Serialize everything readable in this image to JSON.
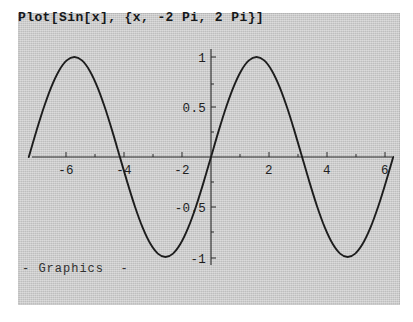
{
  "window": {
    "background_color": "#ffffff",
    "panel_color": "#c9c9c9"
  },
  "cell": {
    "input_title": "Plot[Sin[x], {x, -2 Pi, 2 Pi}]",
    "output_label": "- Graphics  -"
  },
  "chart_data": {
    "type": "line",
    "title": "Plot[Sin[x], {x, -2 Pi, 2 Pi}]",
    "function": "Sin[x]",
    "variable": "x",
    "domain_expression": "{x, -2 Pi, 2 Pi}",
    "xlabel": "",
    "ylabel": "",
    "xlim": [
      -6.283185307,
      6.283185307
    ],
    "ylim": [
      -1,
      1
    ],
    "grid": false,
    "legend": false,
    "legend_position": "none",
    "axis_style": "crossing-axes-at-origin",
    "curve_color": "#1d1d1d",
    "xticks": [
      -6,
      -4,
      -2,
      2,
      4,
      6
    ],
    "xtick_labels": [
      "-6",
      "-4",
      "-2",
      "2",
      "4",
      "6"
    ],
    "yticks": [
      1,
      0.5,
      -0.5,
      -1
    ],
    "ytick_labels": [
      "1",
      "0.5",
      "-0.5",
      "-1"
    ],
    "x": [
      -6.2832,
      -6.0,
      -5.7596,
      -5.4978,
      -5.236,
      -4.9742,
      -4.7124,
      -4.4506,
      -4.1888,
      -3.927,
      -3.6652,
      -3.4034,
      -3.1416,
      -2.8798,
      -2.618,
      -2.3562,
      -2.0944,
      -1.8326,
      -1.5708,
      -1.309,
      -1.0472,
      -0.7854,
      -0.5236,
      -0.2618,
      0.0,
      0.2618,
      0.5236,
      0.7854,
      1.0472,
      1.309,
      1.5708,
      1.8326,
      2.0944,
      2.3562,
      2.618,
      2.8798,
      3.1416,
      3.4034,
      3.6652,
      3.927,
      4.1888,
      4.4506,
      4.7124,
      4.9742,
      5.236,
      5.4978,
      5.7596,
      6.0,
      6.2832
    ],
    "y": [
      0.0,
      0.2794,
      0.5,
      0.7071,
      0.866,
      0.9659,
      1.0,
      0.9659,
      0.866,
      0.7071,
      0.5,
      0.2588,
      0.0,
      -0.2588,
      -0.5,
      -0.7071,
      -0.866,
      -0.9659,
      -1.0,
      -0.9659,
      -0.866,
      -0.7071,
      -0.5,
      -0.2588,
      0.0,
      0.2588,
      0.5,
      0.7071,
      0.866,
      0.9659,
      1.0,
      0.9659,
      0.866,
      0.7071,
      0.5,
      0.2588,
      0.0,
      -0.2588,
      -0.5,
      -0.7071,
      -0.866,
      -0.9659,
      -1.0,
      -0.9659,
      -0.866,
      -0.7071,
      -0.5,
      -0.2794,
      0.0
    ],
    "extrema": [
      {
        "label": "maximum",
        "x": -4.712,
        "y": 1
      },
      {
        "label": "minimum",
        "x": -1.571,
        "y": -1
      },
      {
        "label": "maximum",
        "x": 1.571,
        "y": 1
      },
      {
        "label": "minimum",
        "x": 4.712,
        "y": -1
      }
    ],
    "zero_crossings": [
      -6.283,
      -3.142,
      0,
      3.142,
      6.283
    ]
  }
}
